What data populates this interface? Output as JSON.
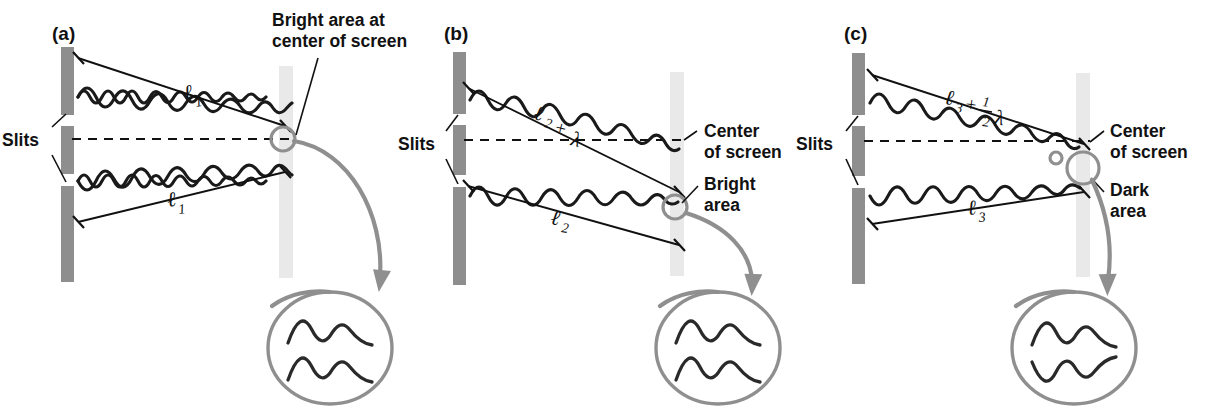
{
  "figure": {
    "background": "#ffffff",
    "colors": {
      "barrier": "#8e8e8e",
      "screen": "#e9e9e9",
      "wave": "#1a1a1a",
      "annotation_gray": "#8f8f8f",
      "text": "#111111"
    }
  },
  "panels": [
    {
      "tag": "(a)",
      "slits_label": "Slits",
      "screen_note": "Bright area at\ncenter of screen",
      "screen_note_line1": "Bright area at",
      "screen_note_line2": "center of screen",
      "path_upper": {
        "base": "ℓ",
        "sub": "1",
        "extra": ""
      },
      "path_lower": {
        "base": "ℓ",
        "sub": "1",
        "extra": ""
      },
      "path_upper_text": "ℓ1",
      "path_lower_text": "ℓ1",
      "path_difference": "0",
      "interference": "constructive",
      "result": "bright",
      "inset_phase": "in phase",
      "inset_wave_count": 2
    },
    {
      "tag": "(b)",
      "slits_label": "Slits",
      "center_note_line1": "Center",
      "center_note_line2": "of screen",
      "area_note_line1": "Bright",
      "area_note_line2": "area",
      "path_upper": {
        "base": "ℓ",
        "sub": "2",
        "op": "+",
        "extra": "λ"
      },
      "path_lower": {
        "base": "ℓ",
        "sub": "2",
        "extra": ""
      },
      "path_upper_text": "ℓ2 + λ",
      "path_lower_text": "ℓ2",
      "path_difference": "λ",
      "interference": "constructive",
      "result": "bright",
      "inset_phase": "in phase",
      "inset_wave_count": 2
    },
    {
      "tag": "(c)",
      "slits_label": "Slits",
      "center_note_line1": "Center",
      "center_note_line2": "of screen",
      "area_note_line1": "Dark",
      "area_note_line2": "area",
      "path_upper": {
        "base": "ℓ",
        "sub": "3",
        "op": "+",
        "frac_num": "1",
        "frac_den": "2",
        "extra": "λ"
      },
      "path_lower": {
        "base": "ℓ",
        "sub": "3",
        "extra": ""
      },
      "path_upper_text": "ℓ3 + ½λ",
      "path_lower_text": "ℓ3",
      "path_difference": "½λ",
      "interference": "destructive",
      "result": "dark",
      "inset_phase": "out of phase",
      "inset_wave_count": 2
    }
  ]
}
